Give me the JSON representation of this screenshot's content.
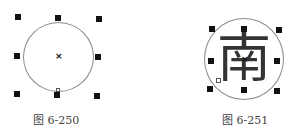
{
  "figures": [
    {
      "caption": "图 6-250",
      "center_marker": "×",
      "description": "circle selected with 8 scaling handles, center marker x"
    },
    {
      "caption": "图 6-251",
      "character": "南",
      "center_marker": "×",
      "description": "circle with character 南 inside, selected with 8 handles"
    }
  ],
  "colors": {
    "handle": "#111111",
    "circle_stroke": "#8a8a8a",
    "caption": "#444444"
  }
}
